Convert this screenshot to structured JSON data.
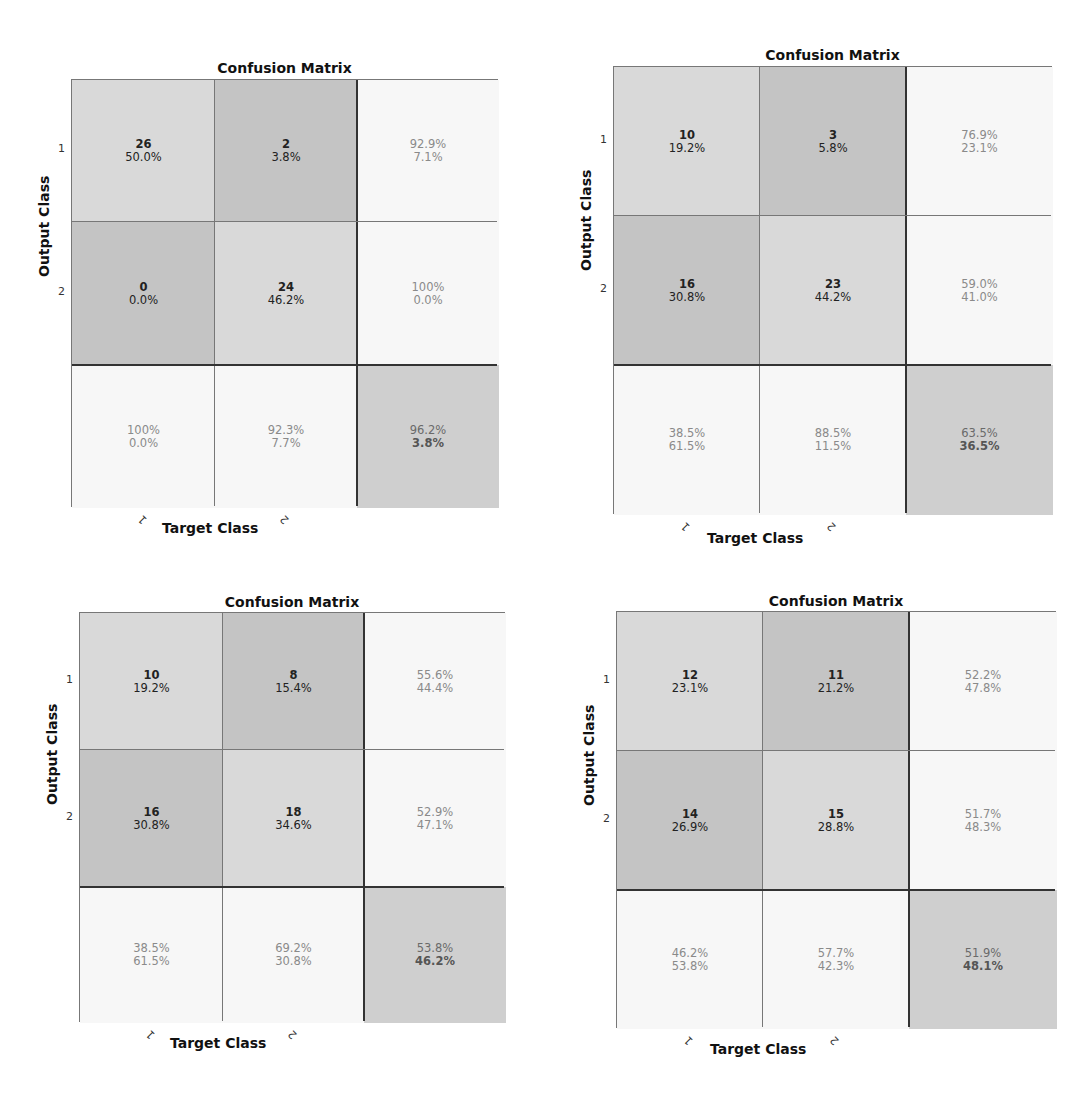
{
  "chart_data": [
    {
      "type": "heatmap",
      "title": "Confusion Matrix",
      "xlabel": "Target Class",
      "ylabel": "Output Class",
      "x_ticks": [
        "1",
        "2"
      ],
      "y_ticks": [
        "1",
        "2"
      ],
      "matrix": [
        [
          26,
          2
        ],
        [
          0,
          24
        ]
      ],
      "matrix_pct": [
        [
          "50.0%",
          "3.8%"
        ],
        [
          "0.0%",
          "46.2%"
        ]
      ],
      "row_summary": [
        [
          "92.9%",
          "7.1%"
        ],
        [
          "100%",
          "0.0%"
        ]
      ],
      "col_summary": [
        [
          "100%",
          "0.0%"
        ],
        [
          "92.3%",
          "7.7%"
        ]
      ],
      "overall": [
        "96.2%",
        "3.8%"
      ]
    },
    {
      "type": "heatmap",
      "title": "Confusion Matrix",
      "xlabel": "Target Class",
      "ylabel": "Output Class",
      "x_ticks": [
        "1",
        "2"
      ],
      "y_ticks": [
        "1",
        "2"
      ],
      "matrix": [
        [
          10,
          3
        ],
        [
          16,
          23
        ]
      ],
      "matrix_pct": [
        [
          "19.2%",
          "5.8%"
        ],
        [
          "30.8%",
          "44.2%"
        ]
      ],
      "row_summary": [
        [
          "76.9%",
          "23.1%"
        ],
        [
          "59.0%",
          "41.0%"
        ]
      ],
      "col_summary": [
        [
          "38.5%",
          "61.5%"
        ],
        [
          "88.5%",
          "11.5%"
        ]
      ],
      "overall": [
        "63.5%",
        "36.5%"
      ]
    },
    {
      "type": "heatmap",
      "title": "Confusion Matrix",
      "xlabel": "Target Class",
      "ylabel": "Output Class",
      "x_ticks": [
        "1",
        "2"
      ],
      "y_ticks": [
        "1",
        "2"
      ],
      "matrix": [
        [
          10,
          8
        ],
        [
          16,
          18
        ]
      ],
      "matrix_pct": [
        [
          "19.2%",
          "15.4%"
        ],
        [
          "30.8%",
          "34.6%"
        ]
      ],
      "row_summary": [
        [
          "55.6%",
          "44.4%"
        ],
        [
          "52.9%",
          "47.1%"
        ]
      ],
      "col_summary": [
        [
          "38.5%",
          "61.5%"
        ],
        [
          "69.2%",
          "30.8%"
        ]
      ],
      "overall": [
        "53.8%",
        "46.2%"
      ]
    },
    {
      "type": "heatmap",
      "title": "Confusion Matrix",
      "xlabel": "Target Class",
      "ylabel": "Output Class",
      "x_ticks": [
        "1",
        "2"
      ],
      "y_ticks": [
        "1",
        "2"
      ],
      "matrix": [
        [
          12,
          11
        ],
        [
          14,
          15
        ]
      ],
      "matrix_pct": [
        [
          "23.1%",
          "21.2%"
        ],
        [
          "26.9%",
          "28.8%"
        ]
      ],
      "row_summary": [
        [
          "52.2%",
          "47.8%"
        ],
        [
          "51.7%",
          "48.3%"
        ]
      ],
      "col_summary": [
        [
          "46.2%",
          "53.8%"
        ],
        [
          "57.7%",
          "42.3%"
        ]
      ],
      "overall": [
        "51.9%",
        "48.1%"
      ]
    }
  ],
  "colors": {
    "diagonal": "#d9d9d9",
    "off_diagonal": "#c4c4c4",
    "summary": "#f7f7f7",
    "overall": "#cfcfcf"
  }
}
